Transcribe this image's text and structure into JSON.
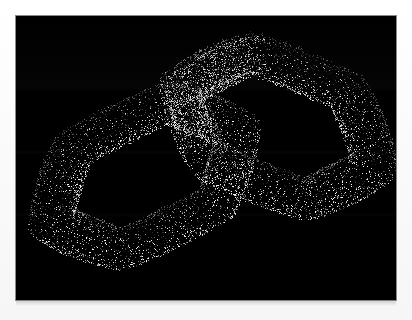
{
  "figure": {
    "kind": "point-cloud-scatter",
    "caption": "",
    "background_color": "#000000",
    "page_color": "#fdfdfd",
    "point_color": "#ffffff",
    "frame": {
      "x": 16,
      "y": 16,
      "width": 380,
      "height": 284
    },
    "border_color": "#8a8a8a"
  },
  "chart_data": {
    "type": "scatter",
    "title": "",
    "subtitle": "",
    "xlabel": "",
    "ylabel": "",
    "grid": false,
    "legend": [],
    "axis_visible": false,
    "tick_labels": {
      "x": [],
      "y": []
    },
    "xlim": [
      0,
      380
    ],
    "ylim": [
      0,
      284
    ],
    "point_color": "#ffffff",
    "point_size_px": 1,
    "background": "#000000",
    "n_points_approx": 9000,
    "series": [
      {
        "name": "ring-a",
        "role": "left-lower-ring",
        "shape": "hexagonal-torus",
        "center": [
          128,
          160
        ],
        "radius_major": 104,
        "radius_minor": 19,
        "tilt_deg": -26,
        "squash": 0.62,
        "n_sides": 6,
        "n_points": 4500,
        "vertices": [
          [
            36,
            118
          ],
          [
            70,
            74
          ],
          [
            146,
            64
          ],
          [
            214,
            112
          ],
          [
            186,
            200
          ],
          [
            96,
            232
          ]
        ]
      },
      {
        "name": "ring-b",
        "role": "right-upper-ring",
        "shape": "hexagonal-torus",
        "center": [
          262,
          110
        ],
        "radius_major": 104,
        "radius_minor": 19,
        "tilt_deg": 22,
        "squash": 0.64,
        "n_sides": 6,
        "n_points": 4500,
        "vertices": [
          [
            178,
            94
          ],
          [
            236,
            38
          ],
          [
            330,
            44
          ],
          [
            366,
            104
          ],
          [
            320,
            178
          ],
          [
            226,
            178
          ]
        ]
      }
    ],
    "annotations": []
  },
  "accessibility": {
    "alt_text": "Black rectangular panel containing two interlocking white point-cloud rings forming a link"
  }
}
